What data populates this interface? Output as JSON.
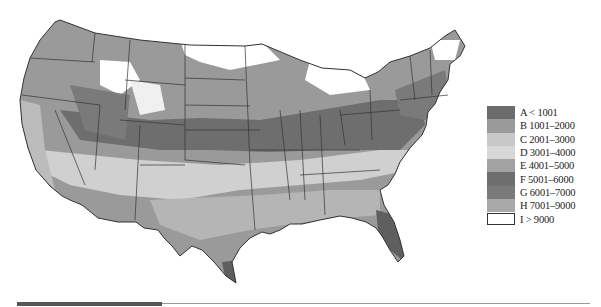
{
  "map": {
    "region": "Contiguous United States",
    "description": "Grayscale choropleth map of US states with shaded zones",
    "state_borders": true
  },
  "legend": {
    "items": [
      {
        "code": "A",
        "label": "A < 1001",
        "color": "#6b6b6b"
      },
      {
        "code": "B",
        "label": "B 1001–2000",
        "color": "#9a9a9a"
      },
      {
        "code": "C",
        "label": "C 2001–3000",
        "color": "#c8c8c8"
      },
      {
        "code": "D",
        "label": "D 3001–4000",
        "color": "#d8d8d8"
      },
      {
        "code": "E",
        "label": "E 4001–5000",
        "color": "#a2a2a2"
      },
      {
        "code": "F",
        "label": "F 5001–6000",
        "color": "#6e6e6e"
      },
      {
        "code": "G",
        "label": "G 6001–7000",
        "color": "#7a7a7a"
      },
      {
        "code": "H",
        "label": "H 7001–9000",
        "color": "#a8a8a8"
      },
      {
        "code": "I",
        "label": "I > 9000",
        "color": "#ffffff"
      }
    ]
  },
  "colors": {
    "border": "#333333",
    "background": "#ffffff",
    "bottom_bar": "#555555"
  }
}
